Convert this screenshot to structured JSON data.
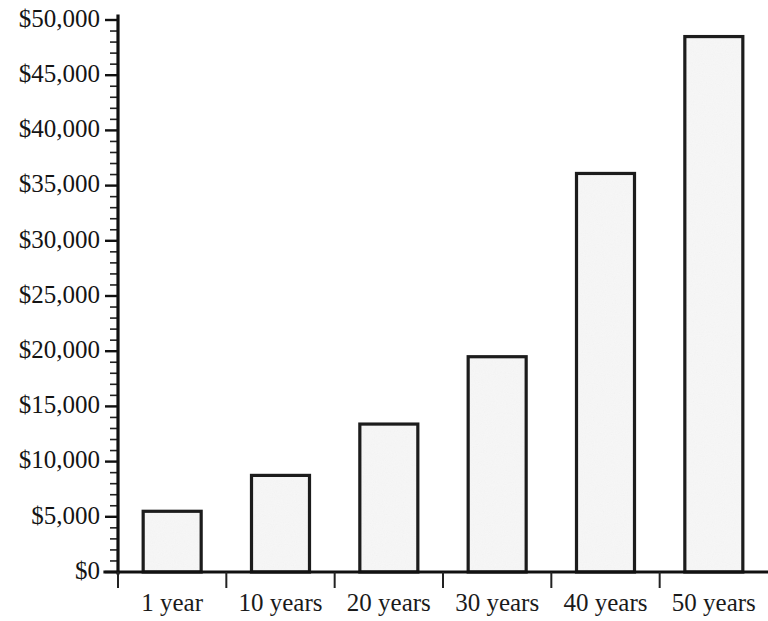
{
  "chart_data": {
    "type": "bar",
    "title": "",
    "subtitle": "",
    "xlabel": "",
    "ylabel": "",
    "categories": [
      "1 year",
      "10 years",
      "20 years",
      "30 years",
      "40 years",
      "50 years"
    ],
    "values": [
      5500,
      8750,
      13400,
      19500,
      36100,
      48500
    ],
    "series": [
      {
        "name": "Savings balance",
        "values": [
          5500,
          8750,
          13400,
          19500,
          36100,
          48500
        ]
      }
    ],
    "ylim": [
      0,
      50000
    ],
    "y_major_step": 5000,
    "y_minor_step": 1000,
    "ytick_labels": [
      "$0",
      "$5,000",
      "$10,000",
      "$15,000",
      "$20,000",
      "$25,000",
      "$30,000",
      "$35,000",
      "$40,000",
      "$45,000",
      "$50,000"
    ],
    "ytick_values": [
      0,
      5000,
      10000,
      15000,
      20000,
      25000,
      30000,
      35000,
      40000,
      45000,
      50000
    ],
    "grid": false,
    "legend": null,
    "legend_position": "none",
    "annotations": [],
    "bar_fill_color": "#ededed",
    "bar_edge_color": "#1c1c1c",
    "axis_color": "#111111",
    "background_color": "#ffffff"
  },
  "axes": {
    "x_axis_name": "x-axis",
    "y_axis_name": "y-axis"
  }
}
